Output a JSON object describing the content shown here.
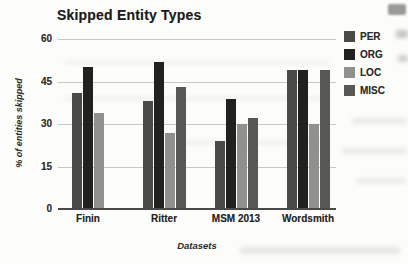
{
  "chart_data": {
    "type": "bar",
    "title": "Skipped Entity Types",
    "xlabel": "Datasets",
    "ylabel": "% of entities skipped",
    "categories": [
      "Finin",
      "Ritter",
      "MSM 2013",
      "Wordsmith"
    ],
    "series": [
      {
        "name": "PER",
        "color": "#4a4a48",
        "values": [
          41,
          38,
          24,
          49
        ]
      },
      {
        "name": "ORG",
        "color": "#212120",
        "values": [
          50,
          52,
          39,
          49
        ]
      },
      {
        "name": "LOC",
        "color": "#90908d",
        "values": [
          34,
          27,
          30,
          30
        ]
      },
      {
        "name": "MISC",
        "color": "#585856",
        "values": [
          null,
          43,
          32,
          49
        ]
      }
    ],
    "ylim": [
      0,
      60
    ],
    "yticks": [
      0,
      15,
      30,
      45,
      60
    ],
    "grid": true,
    "legend_position": "right",
    "colors": {
      "gridline": "#c7c7c4",
      "axis_line": "#4a4a48",
      "text": "#1c1c1c",
      "background": "#fcfcfa"
    }
  }
}
